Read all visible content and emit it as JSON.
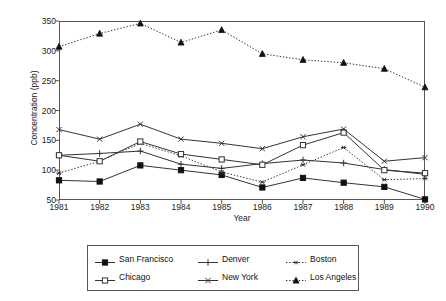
{
  "chart_data": {
    "type": "line",
    "title": "",
    "xlabel": "Year",
    "ylabel": "Concentration (ppb)",
    "x": [
      1981,
      1982,
      1983,
      1984,
      1985,
      1986,
      1987,
      1988,
      1989,
      1990
    ],
    "categories": [
      "1981",
      "1982",
      "1983",
      "1984",
      "1985",
      "1986",
      "1987",
      "1988",
      "1989",
      "1990"
    ],
    "xlim": [
      1981,
      1990
    ],
    "ylim": [
      50,
      350
    ],
    "yticks": [
      50,
      100,
      150,
      200,
      250,
      300,
      350
    ],
    "xticks": [
      "1981",
      "1982",
      "1983",
      "1984",
      "1985",
      "1986",
      "1987",
      "1988",
      "1989",
      "1990"
    ],
    "grid": false,
    "legend_position": "below-plot",
    "series": [
      {
        "name": "San Francisco",
        "marker": "filled-square",
        "linestyle": "solid",
        "values": [
          83,
          81,
          108,
          100,
          92,
          71,
          87,
          79,
          72,
          51
        ]
      },
      {
        "name": "Denver",
        "marker": "plus",
        "linestyle": "solid",
        "values": [
          125,
          128,
          132,
          110,
          103,
          111,
          117,
          112,
          101,
          93
        ]
      },
      {
        "name": "Boston",
        "marker": "asterisk",
        "linestyle": "dotted",
        "values": [
          95,
          115,
          145,
          124,
          97,
          80,
          109,
          138,
          84,
          86
        ]
      },
      {
        "name": "Chicago",
        "marker": "open-square",
        "linestyle": "solid",
        "values": [
          125,
          115,
          148,
          127,
          118,
          109,
          142,
          163,
          100,
          95
        ]
      },
      {
        "name": "New York",
        "marker": "x",
        "linestyle": "solid",
        "values": [
          168,
          152,
          177,
          152,
          145,
          136,
          156,
          169,
          115,
          121
        ]
      },
      {
        "name": "Los Angeles",
        "marker": "filled-triangle",
        "linestyle": "dotted",
        "values": [
          307,
          329,
          346,
          314,
          335,
          295,
          285,
          280,
          270,
          239
        ]
      }
    ]
  },
  "legend": {
    "items": [
      {
        "label": "San Francisco",
        "key": "sf-key"
      },
      {
        "label": "Denver",
        "key": "denver-key"
      },
      {
        "label": "Boston",
        "key": "boston-key"
      },
      {
        "label": "Chicago",
        "key": "chicago-key"
      },
      {
        "label": "New York",
        "key": "newyork-key"
      },
      {
        "label": "Los Angeles",
        "key": "losangeles-key"
      }
    ]
  },
  "colors": {
    "line": "#333333",
    "axis": "#555555",
    "text": "#1a1a1a",
    "background": "#ffffff"
  }
}
